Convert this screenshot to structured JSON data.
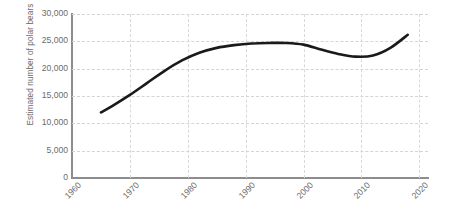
{
  "chart_data": {
    "type": "line",
    "title": "",
    "xlabel": "",
    "ylabel": "Estimated number of polar bears",
    "xlim": [
      1960,
      2021.5
    ],
    "ylim": [
      0,
      30000
    ],
    "grid": true,
    "legend": false,
    "x_ticks": [
      "1960",
      "1970",
      "1980",
      "1990",
      "2000",
      "2010",
      "2020"
    ],
    "x_tick_values": [
      1960,
      1970,
      1980,
      1990,
      2000,
      2010,
      2020
    ],
    "y_ticks": [
      "0",
      "5,000",
      "10,000",
      "15,000",
      "20,000",
      "25,000",
      "30,000"
    ],
    "y_tick_values": [
      0,
      5000,
      10000,
      15000,
      20000,
      25000,
      30000
    ],
    "series": [
      {
        "name": "Estimated number of polar bears",
        "color": "#1a1a1a",
        "x": [
          1965,
          1967,
          1970,
          1973,
          1976,
          1979,
          1982,
          1985,
          1988,
          1991,
          1994,
          1997,
          2000,
          2003,
          2006,
          2009,
          2012,
          2015,
          2018
        ],
        "values": [
          12000,
          13200,
          15200,
          17400,
          19600,
          21500,
          22900,
          23800,
          24300,
          24600,
          24700,
          24700,
          24400,
          23500,
          22700,
          22200,
          22400,
          23800,
          26200
        ]
      }
    ]
  }
}
